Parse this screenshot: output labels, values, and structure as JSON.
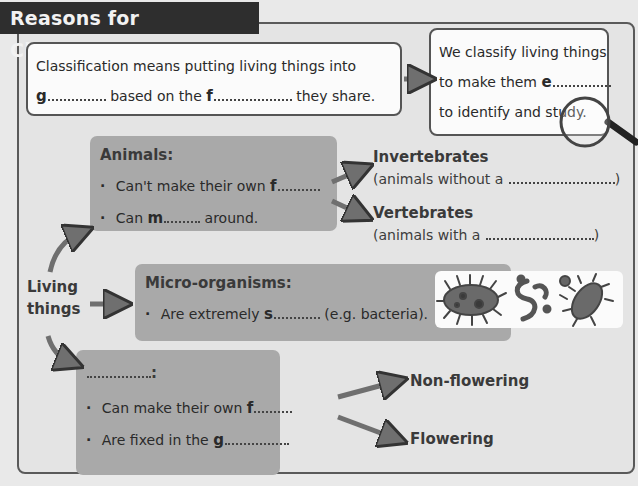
{
  "title": "Reasons for Classification",
  "definition_box": {
    "line1": "Classification means putting living things into",
    "line2_lead": "g",
    "line2_mid": "based on the",
    "line2_lead2": "f",
    "line2_end": "they share."
  },
  "purpose_box": {
    "line1": "We classify living things",
    "line2": "to make them",
    "line2_lead": "e",
    "line3_a": "to identify and",
    "line3_b": "study."
  },
  "living_things": {
    "line1": "Living",
    "line2": "things"
  },
  "animals": {
    "heading": "Animals:",
    "bullet1": "Can't make their own",
    "bullet1_lead": "f",
    "bullet2_a": "Can",
    "bullet2_lead": "m",
    "bullet2_b": "around.",
    "invertebrates": {
      "title": "Invertebrates",
      "desc": "(animals without a",
      "close": ")"
    },
    "vertebrates": {
      "title": "Vertebrates",
      "desc": "(animals with a",
      "close": ")"
    }
  },
  "micro_organisms": {
    "heading": "Micro-organisms:",
    "bullet_a": "Are extremely",
    "bullet_lead": "s",
    "bullet_b": "(e.g. bacteria).",
    "image_icons": [
      "microbe-icon",
      "worm-microbe-icon",
      "bacillus-icon"
    ]
  },
  "plants": {
    "heading_colon": ":",
    "bullet1": "Can make their own",
    "bullet1_lead": "f",
    "bullet2": "Are fixed in the",
    "bullet2_lead": "g",
    "non_flowering": "Non-flowering",
    "flowering": "Flowering"
  },
  "colors": {
    "title_bg": "#2e2e2e",
    "panel_bg": "#e4e4e4",
    "grey_box": "#a9a9a9",
    "arrow": "#6f6f6f"
  }
}
